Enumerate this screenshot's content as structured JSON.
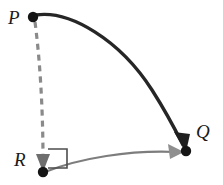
{
  "figure": {
    "background_color": "#ffffff",
    "width": 223,
    "height": 185,
    "labels": {
      "p": "P",
      "r": "R",
      "q": "Q"
    },
    "points": [
      {
        "id": "P",
        "label": "P",
        "x": 33,
        "y": 17,
        "radius": 5.2,
        "color": "#151515"
      },
      {
        "id": "R",
        "label": "R",
        "x": 43,
        "y": 172,
        "radius": 5.2,
        "color": "#151515"
      },
      {
        "id": "Q",
        "label": "Q",
        "x": 186,
        "y": 151,
        "radius": 5.2,
        "color": "#151515"
      }
    ],
    "arrows": [
      {
        "id": "pq-arrow",
        "name": "solid-curve-p-to-q",
        "from": "P",
        "to": "Q",
        "style": "solid",
        "color": "#262626",
        "width": 3.4,
        "arrowhead": true,
        "path": "M 36 15 C 70 10, 120 40, 152 90 C 168 115, 178 135, 183 145"
      },
      {
        "id": "pr-arrow",
        "name": "dashed-line-p-to-r",
        "from": "P",
        "to": "R",
        "style": "dashed",
        "dash_pattern": "6,5",
        "color": "#8a8a8a",
        "width": 3.2,
        "arrowhead": true,
        "path": "M 35 22 C 40 60, 43 110, 43 160"
      },
      {
        "id": "rq-arrow",
        "name": "gray-curve-r-to-q",
        "from": "R",
        "to": "Q",
        "style": "solid",
        "color": "#7d7d7d",
        "width": 2.2,
        "arrowhead": true,
        "path": "M 45 172 C 80 158, 130 150, 176 152"
      }
    ],
    "right_angle": {
      "id": "right-angle-marker",
      "at": "R",
      "color": "#4d4d4d",
      "width": 1.6,
      "path": "M 48 149 L 67 149 L 67 168 L 48 168"
    }
  }
}
